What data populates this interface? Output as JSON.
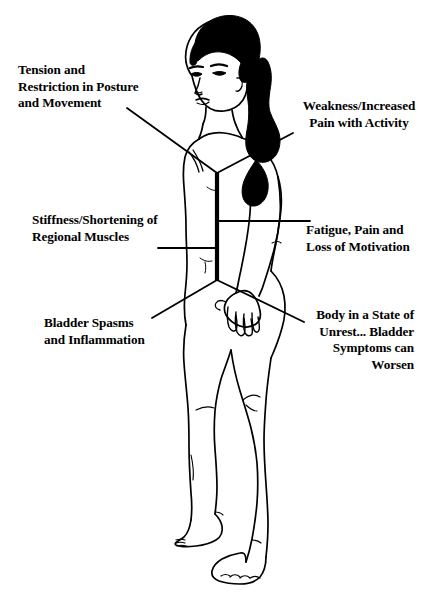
{
  "diagram": {
    "background_color": "#ffffff",
    "ink_color": "#000000",
    "hair_color": "#000000",
    "labels": [
      {
        "id": "tension",
        "text": "Tension and\nRestriction in Posture\nand Movement",
        "align": "left",
        "position": "upper-left"
      },
      {
        "id": "weakness",
        "text": "Weakness/Increased\nPain with Activity",
        "align": "center",
        "position": "upper-right"
      },
      {
        "id": "stiffness",
        "text": "Stiffness/Shortening of\nRegional Muscles",
        "align": "left",
        "position": "middle-left"
      },
      {
        "id": "fatigue",
        "text": "Fatigue, Pain and\nLoss of Motivation",
        "align": "left",
        "position": "middle-right"
      },
      {
        "id": "bladder",
        "text": "Bladder Spasms\nand Inflammation",
        "align": "left",
        "position": "lower-left"
      },
      {
        "id": "unrest",
        "text": "Body in a State of\nUnrest... Bladder\nSymptoms can\nWorsen",
        "align": "right",
        "position": "lower-right"
      }
    ]
  }
}
